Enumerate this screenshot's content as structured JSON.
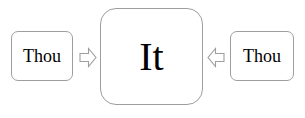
{
  "diagram": {
    "background_color": "#ffffff",
    "stroke_color": "#9e9e9e",
    "text_color": "#000000",
    "nodes": [
      {
        "id": "thou-left",
        "label": "Thou",
        "shape": "rounded-rectangle",
        "position": "left"
      },
      {
        "id": "it-center",
        "label": "It",
        "shape": "rounded-rectangle",
        "position": "center"
      },
      {
        "id": "thou-right",
        "label": "Thou",
        "shape": "rounded-rectangle",
        "position": "right"
      }
    ],
    "arrows": [
      {
        "id": "left-to-center",
        "icon": "block-arrow-right-icon",
        "direction": "right",
        "from": "thou-left",
        "to": "it-center"
      },
      {
        "id": "right-to-center",
        "icon": "block-arrow-left-icon",
        "direction": "left",
        "from": "thou-right",
        "to": "it-center"
      }
    ]
  }
}
